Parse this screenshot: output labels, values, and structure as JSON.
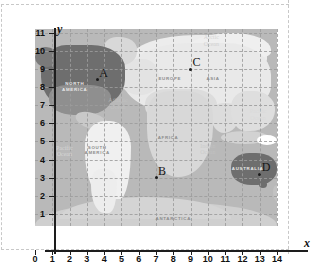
{
  "chart_data": {
    "type": "scatter",
    "title": "",
    "xlabel": "x",
    "ylabel": "y",
    "xlim": [
      0,
      14
    ],
    "ylim": [
      0,
      11
    ],
    "grid": true,
    "legend": "none",
    "x_ticks": [
      "0",
      "1",
      "2",
      "3",
      "4",
      "5",
      "6",
      "7",
      "8",
      "9",
      "10",
      "11",
      "12",
      "13",
      "14"
    ],
    "y_ticks": [
      "1",
      "2",
      "3",
      "4",
      "5",
      "6",
      "7",
      "8",
      "9",
      "10",
      "11"
    ],
    "points": [
      {
        "label": "A",
        "x": 3.6,
        "y": 8.4
      },
      {
        "label": "B",
        "x": 7.0,
        "y": 3.0
      },
      {
        "label": "C",
        "x": 9.0,
        "y": 9.0
      },
      {
        "label": "D",
        "x": 13.0,
        "y": 3.2
      }
    ],
    "annotations": [
      {
        "text": "NORTH\nAMERICA",
        "x": 2.3,
        "y": 8.0
      },
      {
        "text": "SOUTH\nAMERICA",
        "x": 3.6,
        "y": 4.5
      },
      {
        "text": "EUROPE",
        "x": 7.8,
        "y": 8.3
      },
      {
        "text": "ASIA",
        "x": 10.3,
        "y": 8.3
      },
      {
        "text": "AFRICA",
        "x": 7.7,
        "y": 5.0
      },
      {
        "text": "AUSTRALIA",
        "x": 12.3,
        "y": 3.3
      },
      {
        "text": "ANTARCTICA",
        "x": 8.0,
        "y": 0.55
      },
      {
        "text": "Arctic\nOcean",
        "x": 10.2,
        "y": 10.6
      },
      {
        "text": "Atlantic\nOcean",
        "x": 4.8,
        "y": 7.1
      },
      {
        "text": "Pacific\nOcean",
        "x": 1.7,
        "y": 4.5
      },
      {
        "text": "Indian\nOcean",
        "x": 10.0,
        "y": 4.6
      },
      {
        "text": "Pacific\nOcean",
        "x": 12.9,
        "y": 6.5
      }
    ]
  },
  "figure": {
    "axis_x_name": "x",
    "axis_y_name": "y",
    "map": {
      "continents": [
        {
          "name": "north-america",
          "label": "NORTH\nAMERICA",
          "highlight": "dark"
        },
        {
          "name": "south-america",
          "label": "SOUTH\nAMERICA",
          "highlight": "light"
        },
        {
          "name": "europe",
          "label": "EUROPE",
          "highlight": "none"
        },
        {
          "name": "asia",
          "label": "ASIA",
          "highlight": "none"
        },
        {
          "name": "africa",
          "label": "AFRICA",
          "highlight": "none"
        },
        {
          "name": "australia",
          "label": "AUSTRALIA",
          "highlight": "dark"
        },
        {
          "name": "antarctica",
          "label": "ANTARCTICA",
          "highlight": "none"
        }
      ],
      "oceans": [
        {
          "name": "arctic-ocean",
          "label": "Arctic\nOcean"
        },
        {
          "name": "atlantic-ocean",
          "label": "Atlantic\nOcean"
        },
        {
          "name": "pacific-ocean-west",
          "label": "Pacific\nOcean"
        },
        {
          "name": "pacific-ocean-east",
          "label": "Pacific\nOcean"
        },
        {
          "name": "indian-ocean",
          "label": "Indian\nOcean"
        }
      ]
    },
    "colors": {
      "ocean": "#b9b9b9",
      "land": "#d8d8d8",
      "highlight_dark": "#6e6e6e",
      "highlight_light": "#f0f0f0",
      "grid": "#9c9c9c",
      "axis": "#1d1d1d"
    }
  }
}
